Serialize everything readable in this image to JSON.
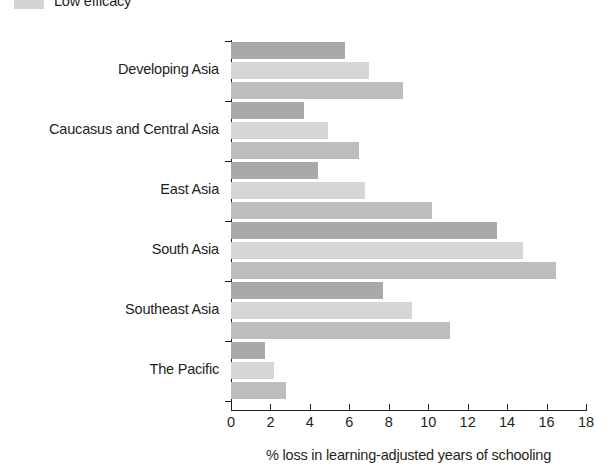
{
  "legend": {
    "entries": [
      {
        "label": "Low efficacy",
        "color": "#d4d4d4"
      }
    ]
  },
  "chart_data": {
    "type": "bar",
    "orientation": "horizontal",
    "title": "",
    "xlabel": "% loss in learning-adjusted years of schooling",
    "ylabel": "",
    "xlim": [
      0,
      18
    ],
    "xticks": [
      0,
      2,
      4,
      6,
      8,
      10,
      12,
      14,
      16,
      18
    ],
    "xtick_labels": [
      "0",
      "2",
      "4",
      "6",
      "8",
      "10",
      "12",
      "14",
      "16",
      "18"
    ],
    "grid": false,
    "legend_position": "top-left",
    "categories": [
      "Developing Asia",
      "Caucasus and Central Asia",
      "East Asia",
      "South Asia",
      "Southeast Asia",
      "The Pacific"
    ],
    "series": [
      {
        "name": "series-1",
        "color": "#a9a9a9",
        "values": [
          5.8,
          3.7,
          4.4,
          13.5,
          7.7,
          1.7
        ]
      },
      {
        "name": "series-2",
        "color": "#d6d6d6",
        "values": [
          7.0,
          4.9,
          6.8,
          14.8,
          9.2,
          2.2
        ]
      },
      {
        "name": "Low efficacy",
        "color": "#bdbdbd",
        "values": [
          8.7,
          6.5,
          10.2,
          16.5,
          11.1,
          2.8
        ]
      }
    ]
  }
}
